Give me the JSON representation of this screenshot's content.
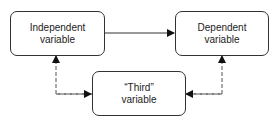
{
  "diagram": {
    "nodes": [
      {
        "id": "independent",
        "line1": "Independent",
        "line2": "variable"
      },
      {
        "id": "dependent",
        "line1": "Dependent",
        "line2": "variable"
      },
      {
        "id": "third",
        "line1": "“Third”",
        "line2": "variable"
      }
    ],
    "edges": [
      {
        "from": "independent",
        "to": "dependent",
        "style": "solid"
      },
      {
        "from": "third",
        "to": "independent",
        "style": "dashed"
      },
      {
        "from": "third",
        "to": "dependent",
        "style": "dashed"
      }
    ],
    "colors": {
      "stroke": "#333333",
      "background": "#ffffff"
    }
  }
}
